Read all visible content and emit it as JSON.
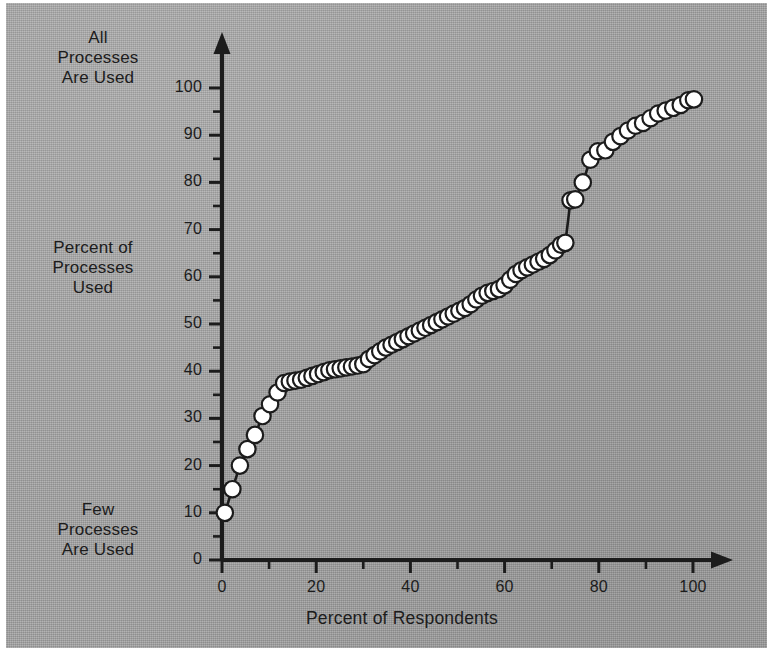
{
  "figure": {
    "background_color": "#a5a5a5",
    "ink_color": "#1c1c1c",
    "marker_fill": "#ffffff",
    "marker_edge": "#1c1c1c"
  },
  "labels": {
    "top_left": "All\nProcesses\nAre Used",
    "mid_left": "Percent of\nProcesses\nUsed",
    "bottom_left": "Few\nProcesses\nAre Used",
    "x_axis_title": "Percent of Respondents"
  },
  "chart_data": {
    "type": "scatter",
    "title": "",
    "subtitle": "",
    "xlabel": "Percent of Respondents",
    "ylabel": "Percent of Processes Used",
    "ylabel_annotation_top": "All Processes Are Used",
    "ylabel_annotation_bottom": "Few Processes Are Used",
    "xlim": [
      0,
      104
    ],
    "ylim": [
      0,
      104
    ],
    "grid": false,
    "legend": null,
    "legend_position": "none",
    "marker": "circle",
    "marker_facecolor": "#ffffff",
    "marker_edgecolor": "#1c1c1c",
    "line_style": "solid",
    "line_color": "#1c1c1c",
    "xticks": [
      0,
      20,
      40,
      60,
      80,
      100
    ],
    "xtick_labels": [
      "0",
      "20",
      "40",
      "60",
      "80",
      "100"
    ],
    "xticks_minor": [
      10,
      30,
      50,
      70,
      90
    ],
    "yticks": [
      0,
      10,
      20,
      30,
      40,
      50,
      60,
      70,
      80,
      90,
      100
    ],
    "ytick_labels": [
      "0",
      "10",
      "20",
      "30",
      "40",
      "50",
      "60",
      "70",
      "80",
      "90",
      "100"
    ],
    "yticks_minor": [
      5,
      15,
      25,
      35,
      45,
      55,
      65,
      75,
      85,
      95
    ],
    "series": [
      {
        "name": "Cumulative process usage",
        "x": [
          0.6,
          2.2,
          3.8,
          5.4,
          7.0,
          8.6,
          10.2,
          11.8,
          13.2,
          14.4,
          15.6,
          16.8,
          18.0,
          19.2,
          20.4,
          21.6,
          22.8,
          24.0,
          25.2,
          26.4,
          27.6,
          28.8,
          30.0,
          31.2,
          32.4,
          33.6,
          34.8,
          36.0,
          37.2,
          38.4,
          39.6,
          40.8,
          42.0,
          43.2,
          44.4,
          45.6,
          46.8,
          48.0,
          49.2,
          50.4,
          51.6,
          52.8,
          54.0,
          55.2,
          56.4,
          57.6,
          58.8,
          60.0,
          61.2,
          62.4,
          63.6,
          64.8,
          66.0,
          67.2,
          68.4,
          69.6,
          70.8,
          72.0,
          72.9,
          74.0,
          75.0,
          76.6,
          78.2,
          79.8,
          81.4,
          83.0,
          84.6,
          86.2,
          87.8,
          89.4,
          91.0,
          92.6,
          94.2,
          95.8,
          97.4,
          99.0,
          100.2
        ],
        "y": [
          10.0,
          15.0,
          20.0,
          23.5,
          26.5,
          30.5,
          33.0,
          35.5,
          37.5,
          37.8,
          38.0,
          38.2,
          38.6,
          39.0,
          39.4,
          39.8,
          40.2,
          40.4,
          40.6,
          40.8,
          41.0,
          41.2,
          41.5,
          42.6,
          43.4,
          44.2,
          45.0,
          45.6,
          46.2,
          46.8,
          47.4,
          48.0,
          48.6,
          49.2,
          49.8,
          50.4,
          51.0,
          51.6,
          52.2,
          52.8,
          53.4,
          54.2,
          55.2,
          56.0,
          56.6,
          57.0,
          57.4,
          58.2,
          59.4,
          60.6,
          61.4,
          62.0,
          62.6,
          63.2,
          63.8,
          64.6,
          65.6,
          66.8,
          67.2,
          76.2,
          76.4,
          80.0,
          84.8,
          86.6,
          86.8,
          88.6,
          89.8,
          91.0,
          92.0,
          92.6,
          93.6,
          94.6,
          95.2,
          95.8,
          96.4,
          97.4,
          97.6
        ]
      }
    ]
  }
}
